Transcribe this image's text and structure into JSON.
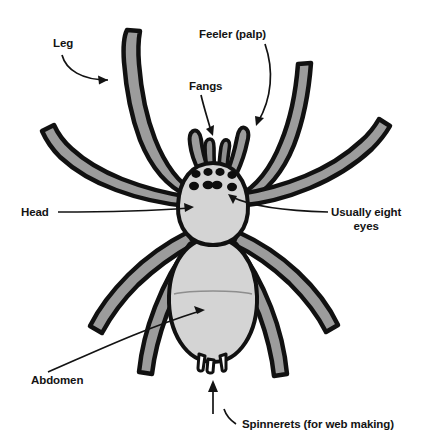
{
  "figure": {
    "background_color": "#ffffff",
    "body_fill": "#d4d4d4",
    "leg_fill": "#9c9c9c",
    "outline_color": "#111111",
    "eye_color": "#0d0d0d",
    "text_color": "#131313"
  },
  "labels": {
    "leg": "Leg",
    "feeler": "Feeler (palp)",
    "fangs": "Fangs",
    "head": "Head",
    "eyes_line1": "Usually eight",
    "eyes_line2": "eyes",
    "abdomen": "Abdomen",
    "spinnerets": "Spinnerets (for web making)"
  }
}
